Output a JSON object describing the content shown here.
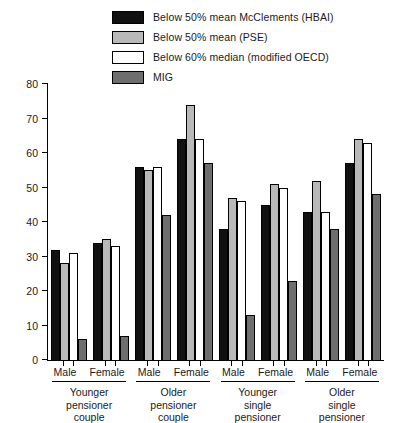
{
  "legend": {
    "position": "top",
    "items": [
      {
        "label": "Below 50% mean McClements (HBAI)",
        "color": "#111111",
        "key": "hbai"
      },
      {
        "label": "Below 50% mean (PSE)",
        "color": "#b9b9b9",
        "key": "pse"
      },
      {
        "label": "Below 60% median (modified OECD)",
        "color": "#ffffff",
        "key": "oecd"
      },
      {
        "label": "MIG",
        "color": "#6e6e6e",
        "key": "mig"
      }
    ]
  },
  "axes": {
    "y_ticks": [
      "0",
      "10",
      "20",
      "30",
      "40",
      "50",
      "60",
      "70",
      "80"
    ],
    "y_min": 0,
    "y_max": 80
  },
  "groups": [
    {
      "title": "Younger\npensioner\ncouple",
      "subgroups": [
        {
          "label": "Male",
          "values": [
            32,
            28,
            31,
            6
          ]
        },
        {
          "label": "Female",
          "values": [
            34,
            35,
            33,
            7
          ]
        }
      ]
    },
    {
      "title": "Older\npensioner\ncouple",
      "subgroups": [
        {
          "label": "Male",
          "values": [
            56,
            55,
            56,
            42
          ]
        },
        {
          "label": "Female",
          "values": [
            64,
            74,
            64,
            57
          ]
        }
      ]
    },
    {
      "title": "Younger\nsingle\npensioner",
      "subgroups": [
        {
          "label": "Male",
          "values": [
            38,
            47,
            46,
            13
          ]
        },
        {
          "label": "Female",
          "values": [
            45,
            51,
            50,
            23
          ]
        }
      ]
    },
    {
      "title": "Older\nsingle\npensioner",
      "subgroups": [
        {
          "label": "Male",
          "values": [
            43,
            52,
            43,
            38
          ]
        },
        {
          "label": "Female",
          "values": [
            57,
            64,
            63,
            48
          ]
        }
      ]
    }
  ],
  "chart_data": {
    "type": "bar",
    "title": "",
    "xlabel": "",
    "ylabel": "",
    "ylim": [
      0,
      80
    ],
    "grid": false,
    "legend_position": "top",
    "categories": [
      "Younger pensioner couple - Male",
      "Younger pensioner couple - Female",
      "Older pensioner couple - Male",
      "Older pensioner couple - Female",
      "Younger single pensioner - Male",
      "Younger single pensioner - Female",
      "Older single pensioner - Male",
      "Older single pensioner - Female"
    ],
    "series": [
      {
        "name": "Below 50% mean McClements (HBAI)",
        "color": "#111111",
        "values": [
          32,
          34,
          56,
          64,
          38,
          45,
          43,
          57
        ]
      },
      {
        "name": "Below 50% mean (PSE)",
        "color": "#b9b9b9",
        "values": [
          28,
          35,
          55,
          74,
          47,
          51,
          52,
          64
        ]
      },
      {
        "name": "Below 60% median (modified OECD)",
        "color": "#ffffff",
        "values": [
          31,
          33,
          56,
          64,
          46,
          50,
          43,
          63
        ]
      },
      {
        "name": "MIG",
        "color": "#6e6e6e",
        "values": [
          6,
          7,
          42,
          57,
          13,
          23,
          38,
          48
        ]
      }
    ],
    "yticks": [
      0,
      10,
      20,
      30,
      40,
      50,
      60,
      70,
      80
    ]
  }
}
